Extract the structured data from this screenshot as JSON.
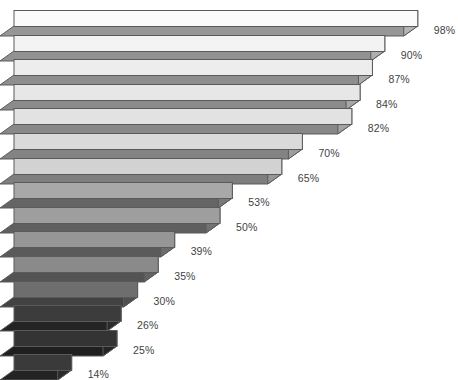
{
  "chart_data": {
    "type": "bar",
    "orientation": "horizontal",
    "style": "3d-extruded-horizontal-bars",
    "title": "",
    "xlabel": "",
    "ylabel": "",
    "categories": [
      "",
      "",
      "",
      "",
      "",
      "",
      "",
      "",
      "",
      "",
      "",
      "",
      "",
      "",
      ""
    ],
    "values": [
      98,
      90,
      87,
      84,
      82,
      70,
      65,
      53,
      50,
      39,
      35,
      30,
      26,
      25,
      14
    ],
    "value_labels": [
      "98%",
      "90%",
      "87%",
      "84%",
      "82%",
      "70%",
      "65%",
      "53%",
      "50%",
      "39%",
      "35%",
      "30%",
      "26%",
      "25%",
      "14%"
    ],
    "xlim": [
      0,
      100
    ],
    "grid": false,
    "legend": false,
    "bar_colors": [
      "#fbfbfb",
      "#f3f3f3",
      "#ededed",
      "#e7e7e7",
      "#e2e2e2",
      "#dadada",
      "#d2d2d2",
      "#a8a8a8",
      "#9e9e9e",
      "#969696",
      "#8a8a8a",
      "#6e6e6e",
      "#3c3c3c",
      "#343434",
      "#3a3a3a"
    ],
    "label_color": "#3f3f3f",
    "background_color": "#ffffff",
    "outline_color": "#5a5a5a"
  },
  "geometry": {
    "bar_left_px": 14,
    "first_bar_top_px": 10,
    "row_pitch_px": 24.6,
    "bar_face_height_px": 16,
    "depth_x_px": 14,
    "depth_y_px": 10,
    "px_per_percent": 4.12,
    "label_gap_px": 16
  }
}
